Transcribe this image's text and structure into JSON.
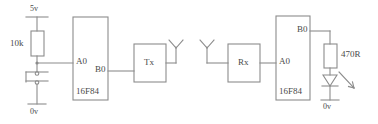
{
  "diagram": {
    "stroke_color": "#8c8c8c",
    "text_color": "#4a4a4a",
    "background_color": "#ffffff"
  },
  "transmitter": {
    "supply_label": "5v",
    "ground_label": "0v",
    "resistor_label": "10k",
    "chip_label": "16F84",
    "pin_input_label": "A0",
    "pin_output_label": "B0",
    "module_label": "Tx",
    "switch_name": "push-button-switch",
    "antenna_name": "tx-antenna"
  },
  "receiver": {
    "ground_label": "0v",
    "resistor_label": "470R",
    "chip_label": "16F84",
    "pin_input_label": "A0",
    "pin_output_label": "B0",
    "module_label": "Rx",
    "led_name": "led",
    "antenna_name": "rx-antenna"
  }
}
